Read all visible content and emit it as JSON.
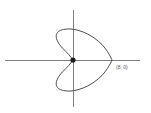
{
  "figure": {
    "background_color": "#ffffff",
    "axis_color": "#808080",
    "curve_color": "#4d4d4d",
    "point_color": "#1a1a1a",
    "label_color": "#555555"
  },
  "labels": {
    "intercept_point": "(8, 0)"
  },
  "chart_data": {
    "type": "line",
    "title": "",
    "subtitle": "",
    "xlabel": "",
    "ylabel": "",
    "grid": false,
    "legend": null,
    "curve_name": "cardioid",
    "polar_equation": "r = 4(1 + cos θ)",
    "axes": {
      "x_axis": {
        "pixel_y": 60,
        "pixel_x_start": 5,
        "pixel_x_end": 140,
        "visible": true
      },
      "y_axis": {
        "pixel_x": 73,
        "pixel_y_start": 10,
        "pixel_y_end": 107,
        "visible": true
      },
      "origin_pixel": [
        73,
        60
      ],
      "xlim": [
        -8,
        16
      ],
      "ylim": [
        -9,
        9
      ]
    },
    "annotations": [
      {
        "text": "(8, 0)",
        "data_point": [
          8,
          0
        ],
        "pixel_x": 116,
        "pixel_y": 64,
        "role": "x-intercept-label"
      }
    ],
    "markers": [
      {
        "name": "origin-cusp",
        "data_point": [
          0,
          0
        ],
        "pixel": [
          73,
          60
        ],
        "radius_px": 2.6,
        "filled": true
      }
    ],
    "series": [
      {
        "name": "cardioid",
        "closed": true,
        "points_pixel": [
          [
            73,
            60
          ],
          [
            77.8,
            52.2
          ],
          [
            84.2,
            45.0
          ],
          [
            91.6,
            38.4
          ],
          [
            99.2,
            33.0
          ],
          [
            105.8,
            30.2
          ],
          [
            110.0,
            29.5
          ],
          [
            112.0,
            31.8
          ],
          [
            112.3,
            37.0
          ],
          [
            110.2,
            43.4
          ],
          [
            106.0,
            50.0
          ],
          [
            100.4,
            55.6
          ],
          [
            94.4,
            59.4
          ],
          [
            89.6,
            60.0
          ],
          [
            94.4,
            60.6
          ],
          [
            100.4,
            64.4
          ],
          [
            106.0,
            70.0
          ],
          [
            110.2,
            76.6
          ],
          [
            112.3,
            83.0
          ],
          [
            112.0,
            88.2
          ],
          [
            110.0,
            90.5
          ],
          [
            105.8,
            89.8
          ],
          [
            99.2,
            87.0
          ],
          [
            91.6,
            81.6
          ],
          [
            84.2,
            75.0
          ],
          [
            77.8,
            67.8
          ],
          [
            73,
            60
          ]
        ],
        "upper_lobe_pixel": [
          [
            73,
            60
          ],
          [
            68.6,
            54.4
          ],
          [
            62.6,
            48.2
          ],
          [
            57.8,
            41.8
          ],
          [
            56.2,
            35.8
          ],
          [
            58.4,
            31.6
          ],
          [
            63.8,
            29.4
          ],
          [
            71.0,
            29.0
          ],
          [
            79.0,
            30.6
          ],
          [
            87.2,
            33.8
          ],
          [
            95.0,
            38.6
          ],
          [
            102.0,
            44.6
          ],
          [
            107.4,
            51.4
          ],
          [
            110.6,
            57.0
          ],
          [
            112.0,
            60.0
          ]
        ],
        "lower_lobe_pixel": [
          [
            73,
            60
          ],
          [
            68.6,
            65.6
          ],
          [
            62.6,
            71.8
          ],
          [
            57.8,
            78.2
          ],
          [
            56.2,
            84.2
          ],
          [
            58.4,
            88.4
          ],
          [
            63.8,
            90.6
          ],
          [
            71.0,
            91.0
          ],
          [
            79.0,
            89.4
          ],
          [
            87.2,
            86.2
          ],
          [
            95.0,
            81.4
          ],
          [
            102.0,
            75.4
          ],
          [
            107.4,
            68.6
          ],
          [
            110.6,
            63.0
          ],
          [
            112.0,
            60.0
          ]
        ]
      }
    ],
    "key_points": [
      {
        "label": "cusp",
        "data_point": [
          0,
          0
        ]
      },
      {
        "label": "x-intercept",
        "data_point": [
          8,
          0
        ]
      }
    ]
  }
}
